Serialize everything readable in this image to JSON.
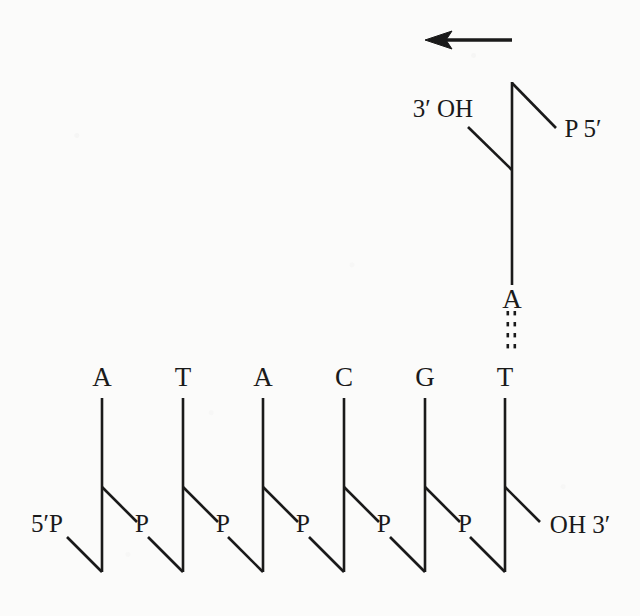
{
  "figure": {
    "ink_color": "#1a1a1a",
    "background_color": "#fbfbfa",
    "arrow": {
      "name": "direction-arrow",
      "direction": "left",
      "x1": 512,
      "y1": 40,
      "x2": 425,
      "y2": 40
    }
  },
  "daughter_strand": {
    "label": "growing strand",
    "five_prime_label": "P  5′",
    "three_prime_label": "3′  OH",
    "base": "A",
    "base_pair_bonds": "⋮"
  },
  "template_strand": {
    "label": "template strand",
    "five_prime_label": "5′P",
    "three_prime_label": "OH 3′",
    "bases": [
      "A",
      "T",
      "A",
      "C",
      "G",
      "T"
    ],
    "phosphate_label": "P",
    "phosphates": [
      "P",
      "P",
      "P",
      "P",
      "P",
      "P"
    ]
  },
  "geometry": {
    "base_xs": [
      102,
      183,
      263,
      344,
      425,
      505
    ],
    "base_label_y": 377,
    "sugar_top_y": 398,
    "sugar_bottom_y": 572,
    "branch_y": 487,
    "phosphate_y": 523,
    "top_unit_x": 512,
    "top_unit_top_y": 82,
    "top_unit_bottom_y": 170,
    "top_base_y": 299,
    "bond_top_y": 311,
    "bond_bottom_y": 355,
    "template_base_top_y": 377
  }
}
